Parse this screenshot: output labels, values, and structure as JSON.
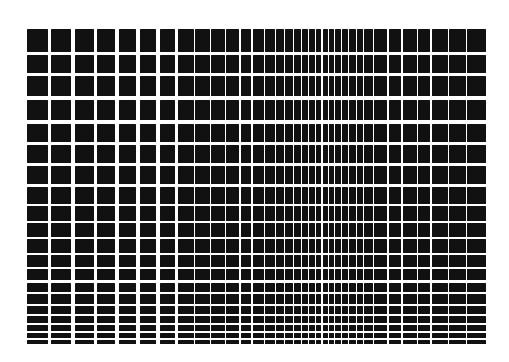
{
  "figure": {
    "type": "optical-illusion-grid",
    "columns": 35,
    "rows": 20,
    "colors": {
      "background": "#ffffff",
      "cell": "#111111"
    }
  }
}
